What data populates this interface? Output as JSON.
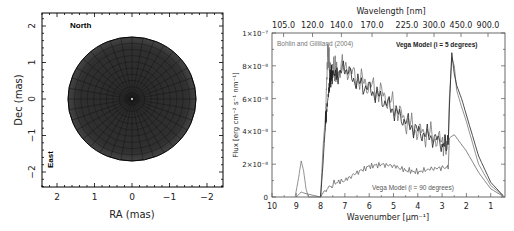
{
  "chart_data": [
    {
      "type": "heatmap",
      "title": "",
      "xlabel": "RA (mas)",
      "ylabel": "Dec (mas)",
      "xlim": [
        2.4,
        -2.4
      ],
      "ylim": [
        -2.4,
        2.4
      ],
      "x_ticks": [
        "2",
        "1",
        "0",
        "−1",
        "−2"
      ],
      "y_ticks": [
        "−2",
        "−1",
        "0",
        "1",
        "2"
      ],
      "annotations": [
        "North",
        "East"
      ],
      "disk": {
        "center": [
          0,
          0
        ],
        "radius_mas": 1.7,
        "description": "stellar surface intensity map with latitude/longitude grid, seen pole-on"
      }
    },
    {
      "type": "line",
      "title": "",
      "xlabel": "Wavenumber [μm⁻¹]",
      "ylabel": "Flux [erg cm⁻² s⁻¹ nm⁻¹]",
      "x2label": "Wavelength [nm]",
      "xlim": [
        10,
        0.45
      ],
      "ylim": [
        0,
        1e-07
      ],
      "x_ticks": [
        "10",
        "9",
        "8",
        "7",
        "6",
        "5",
        "4",
        "3",
        "2",
        "1"
      ],
      "x2_ticks": [
        "105.0",
        "120.0",
        "140.0",
        "170.0",
        "225.0",
        "300.0",
        "450.0",
        "900.0"
      ],
      "y_ticks": [
        "0",
        "2×10⁻⁸",
        "4×10⁻⁸",
        "6×10⁻⁸",
        "8×10⁻⁸",
        "1×10⁻⁷"
      ],
      "legend": [
        "Bohlin and Gilliland (2004)",
        "Vega Model (i = 5 degrees)",
        "Vega Model (i = 90 degrees)"
      ],
      "series": [
        {
          "name": "Bohlin and Gilliland (2004)",
          "x": [
            9.05,
            8.9,
            8.8,
            8.7,
            8.6,
            8.5,
            8.0,
            7.9,
            7.8,
            7.7,
            7.6,
            7.5,
            7.3,
            7.0,
            6.5,
            6.0,
            5.5,
            5.0,
            4.5,
            4.0,
            3.5,
            3.0,
            2.75,
            2.7,
            2.6,
            2.5,
            2.4,
            2.2,
            2.0,
            1.5,
            1.0,
            0.5
          ],
          "y": [
            0,
            1.2e-08,
            2.2e-08,
            1.6e-08,
            5e-09,
            0,
            0,
            3e-08,
            5e-08,
            9e-08,
            7.5e-08,
            8e-08,
            7.6e-08,
            8e-08,
            7.2e-08,
            6.8e-08,
            6.3e-08,
            5.6e-08,
            4.6e-08,
            4e-08,
            3.8e-08,
            3.3e-08,
            3.2e-08,
            6e-08,
            8.5e-08,
            8e-08,
            6.5e-08,
            5.5e-08,
            4.6e-08,
            2e-08,
            7e-09,
            1e-09
          ]
        },
        {
          "name": "Vega Model (i = 5 degrees)",
          "x": [
            8.0,
            7.9,
            7.8,
            7.7,
            7.6,
            7.5,
            7.3,
            7.0,
            6.5,
            6.0,
            5.5,
            5.0,
            4.5,
            4.0,
            3.5,
            3.0,
            2.75,
            2.7,
            2.6,
            2.5,
            2.4,
            2.2,
            2.0,
            1.5,
            1.0,
            0.5
          ],
          "y": [
            0,
            2e-08,
            4.5e-08,
            6e-08,
            7.3e-08,
            7.5e-08,
            7.5e-08,
            7.8e-08,
            7e-08,
            6.6e-08,
            6e-08,
            5.3e-08,
            4.6e-08,
            4e-08,
            3.7e-08,
            3.3e-08,
            3.2e-08,
            5.5e-08,
            8.8e-08,
            7.5e-08,
            6.8e-08,
            6e-08,
            5e-08,
            2.5e-08,
            9e-09,
            1e-09
          ]
        },
        {
          "name": "Vega Model (i = 90 degrees)",
          "x": [
            9.0,
            8.8,
            8.6,
            8.0,
            7.8,
            7.5,
            7.0,
            6.5,
            6.0,
            5.5,
            5.0,
            4.5,
            4.0,
            3.5,
            3.0,
            2.75,
            2.7,
            2.5,
            2.3,
            2.0,
            1.5,
            1.0,
            0.5
          ],
          "y": [
            0,
            3e-09,
            2e-09,
            0,
            5e-09,
            8e-09,
            1e-08,
            1.5e-08,
            1.9e-08,
            2e-08,
            1.9e-08,
            1.6e-08,
            1.5e-08,
            1.7e-08,
            1.8e-08,
            1.7e-08,
            3.6e-08,
            3.8e-08,
            3.4e-08,
            2.8e-08,
            1.5e-08,
            5e-09,
            5e-10
          ]
        }
      ]
    }
  ],
  "left_plot": {
    "xlabel": "RA (mas)",
    "ylabel": "Dec (mas)",
    "north": "North",
    "east": "East",
    "xticks": [
      "2",
      "1",
      "0",
      "−1",
      "−2"
    ],
    "yticks": [
      "2",
      "1",
      "0",
      "−1",
      "−2"
    ]
  },
  "right_plot": {
    "top_label": "Wavelength [nm]",
    "bottom_label": "Wavenumber [μm⁻¹]",
    "ylabel": "Flux [erg cm⁻² s⁻¹ nm⁻¹]",
    "top_ticks": [
      "105.0",
      "120.0",
      "140.0",
      "170.0",
      "225.0",
      "300.0",
      "450.0",
      "900.0"
    ],
    "bottom_ticks": [
      "10",
      "9",
      "8",
      "7",
      "6",
      "5",
      "4",
      "3",
      "2",
      "1"
    ],
    "y_ticks": [
      "0",
      "2×10⁻⁸",
      "4×10⁻⁸",
      "6×10⁻⁸",
      "8×10⁻⁸",
      "1×10⁻⁷"
    ],
    "legend_obs": "Bohlin and Gilliland (2004)",
    "legend_i5": "Vega Model (i = 5 degrees)",
    "legend_i90": "Vega Model (i = 90 degrees)"
  }
}
